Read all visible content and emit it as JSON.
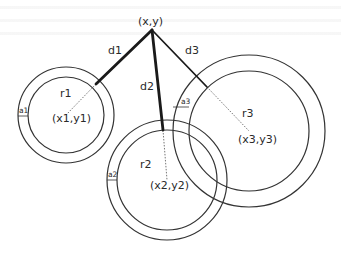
{
  "diagram": {
    "type": "trilateration",
    "apex": {
      "label": "(x,y)",
      "x": 152,
      "y": 30
    },
    "distances": [
      {
        "label": "d1",
        "to": "circle1",
        "end": [
          96,
          84
        ],
        "label_pos": [
          108,
          54
        ]
      },
      {
        "label": "d2",
        "to": "circle2",
        "end": [
          163,
          130
        ],
        "label_pos": [
          140,
          90
        ]
      },
      {
        "label": "d3",
        "to": "circle3",
        "end": [
          207,
          87
        ],
        "label_pos": [
          185,
          54
        ]
      }
    ],
    "circles": [
      {
        "id": "circle1",
        "center": [
          66,
          115
        ],
        "outer_r": 48,
        "inner_r": 38,
        "radius_label": "r1",
        "center_label": "(x1,y1)",
        "band_label": "a1",
        "r_label_pos": [
          60,
          97
        ],
        "c_label_pos": [
          52,
          122
        ],
        "a_label_pos": [
          19,
          113
        ]
      },
      {
        "id": "circle2",
        "center": [
          167,
          180
        ],
        "outer_r": 60,
        "inner_r": 50,
        "radius_label": "r2",
        "center_label": "(x2,y2)",
        "band_label": "a2",
        "r_label_pos": [
          140,
          168
        ],
        "c_label_pos": [
          150,
          189
        ],
        "a_label_pos": [
          108,
          177
        ]
      },
      {
        "id": "circle3",
        "center": [
          249,
          131
        ],
        "outer_r": 76,
        "inner_r": 60,
        "radius_label": "r3",
        "center_label": "(x3,y3)",
        "band_label": "a3",
        "r_label_pos": [
          242,
          117
        ],
        "c_label_pos": [
          238,
          143
        ],
        "a_label_pos": [
          181,
          104
        ]
      }
    ],
    "colors": {
      "stroke": "#333333",
      "thick": "#1a1a1a",
      "dashed": "#666666"
    }
  }
}
